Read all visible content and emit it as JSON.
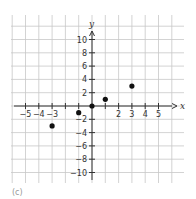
{
  "chart_data": {
    "type": "scatter",
    "title": "",
    "xlabel": "x",
    "ylabel": "y",
    "x": [
      -3,
      -1,
      0,
      1,
      3
    ],
    "y": [
      -3,
      -1,
      0,
      1,
      3
    ],
    "points": [
      {
        "x": -3,
        "y": -3
      },
      {
        "x": -1,
        "y": -1
      },
      {
        "x": 0,
        "y": 0
      },
      {
        "x": 1,
        "y": 1
      },
      {
        "x": 3,
        "y": 3
      }
    ],
    "xlim": [
      -6,
      7
    ],
    "ylim": [
      -12,
      13
    ],
    "x_tick_labels": [
      "-5",
      "-4",
      "-3",
      "2",
      "3",
      "4",
      "5"
    ],
    "x_tick_label_values": [
      -5,
      -4,
      -3,
      2,
      3,
      4,
      5
    ],
    "x_tick_marks": [
      -5,
      -4,
      -3,
      -2,
      -1,
      1,
      2,
      3,
      4,
      5
    ],
    "x_tick_label_one": "1",
    "y_tick_labels": [
      "10",
      "8",
      "6",
      "4",
      "2",
      "-2",
      "-4",
      "-6",
      "-8",
      "-10"
    ],
    "y_tick_label_values": [
      10,
      8,
      6,
      4,
      2,
      -2,
      -4,
      -6,
      -8,
      -10
    ],
    "grid": true,
    "legend": null
  },
  "caption": "(c)"
}
